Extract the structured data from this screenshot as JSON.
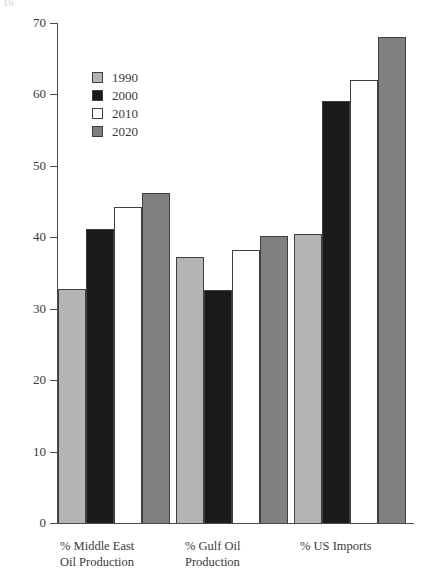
{
  "corner_mark": "16",
  "chart_data": {
    "type": "bar",
    "title": "",
    "subtitle": "",
    "xlabel": "",
    "ylabel": "",
    "ylim": [
      0,
      70
    ],
    "ytick_values": [
      0,
      10,
      20,
      30,
      40,
      50,
      60,
      70
    ],
    "ytick_labels": [
      "0",
      "10",
      "20",
      "30",
      "40",
      "50",
      "60",
      "70"
    ],
    "grid": false,
    "legend_position": "upper-left-inside",
    "categories": [
      "% Middle East\nOil Production",
      "% Gulf Oil\nProduction",
      "% US Imports"
    ],
    "series": [
      {
        "name": "1990",
        "color": "#b5b5b5",
        "values": [
          32.7,
          37.2,
          40.4
        ]
      },
      {
        "name": "2000",
        "color": "#1a1a1a",
        "values": [
          41.2,
          32.6,
          59.1
        ]
      },
      {
        "name": "2010",
        "color": "#ffffff",
        "values": [
          44.2,
          38.2,
          62.0
        ]
      },
      {
        "name": "2020",
        "color": "#808080",
        "values": [
          46.2,
          40.2,
          68.1
        ]
      }
    ]
  },
  "legend": {
    "items": [
      {
        "label": "1990",
        "color": "#b5b5b5"
      },
      {
        "label": "2000",
        "color": "#1a1a1a"
      },
      {
        "label": "2010",
        "color": "#ffffff"
      },
      {
        "label": "2020",
        "color": "#808080"
      }
    ]
  },
  "axis": {
    "border_color": "#4a4a4a"
  }
}
